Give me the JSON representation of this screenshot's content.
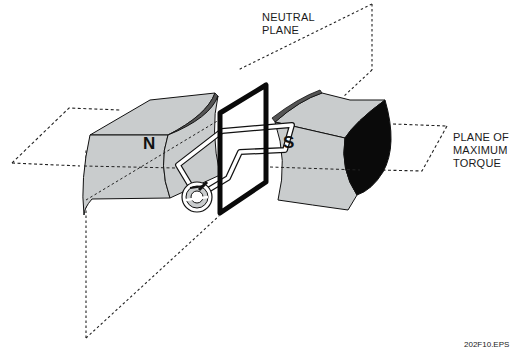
{
  "diagram": {
    "labels": {
      "neutral_plane": [
        "NEUTRAL",
        "PLANE"
      ],
      "plane_of_maximum_torque": [
        "PLANE OF",
        "MAXIMUM",
        "TORQUE"
      ],
      "north_pole": "N",
      "south_pole": "S",
      "figure_id": "202F10.EPS"
    },
    "components": [
      {
        "id": "north-magnet",
        "label": "N"
      },
      {
        "id": "south-magnet",
        "label": "S"
      },
      {
        "id": "armature-loop"
      },
      {
        "id": "commutator"
      },
      {
        "id": "neutral-plane"
      },
      {
        "id": "plane-of-maximum-torque"
      }
    ],
    "colors": {
      "magnet_face": "#c9cccd",
      "magnet_dark": "#0a0a0a",
      "line": "#111111",
      "background": "#ffffff"
    }
  }
}
